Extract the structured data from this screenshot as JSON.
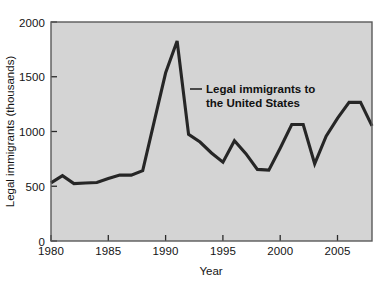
{
  "chart_data": {
    "type": "line",
    "title": "",
    "xlabel": "Year",
    "ylabel": "Legal immigrants (thousands)",
    "xlim": [
      1980,
      2008
    ],
    "ylim": [
      0,
      2000
    ],
    "xticks": [
      1980,
      1985,
      1990,
      1995,
      2000,
      2005
    ],
    "xtick_labels": [
      "1980",
      "1985",
      "1990",
      "1995",
      "2000",
      "2005"
    ],
    "yticks": [
      0,
      500,
      1000,
      1500,
      2000
    ],
    "ytick_labels": [
      "0",
      "500",
      "1000",
      "1500",
      "2000"
    ],
    "grid": false,
    "legend": "none",
    "plot_background": "#d4d4d4",
    "line_color": "#262626",
    "annotations": [
      {
        "text_line_1": "Legal immigrants to",
        "text_line_2": "the United States",
        "x": 1992.5,
        "y": 1330
      }
    ],
    "series": [
      {
        "name": "Legal immigrants to the United States",
        "x": [
          1980,
          1981,
          1982,
          1983,
          1984,
          1985,
          1986,
          1987,
          1988,
          1989,
          1990,
          1991,
          1992,
          1993,
          1994,
          1995,
          1996,
          1997,
          1998,
          1999,
          2000,
          2001,
          2002,
          2003,
          2004,
          2005,
          2006,
          2007,
          2008
        ],
        "values": [
          531,
          597,
          524,
          530,
          534,
          570,
          602,
          602,
          643,
          1091,
          1536,
          1827,
          974,
          904,
          804,
          720,
          916,
          798,
          654,
          647,
          850,
          1064,
          1064,
          705,
          958,
          1122,
          1266,
          1266,
          1052
        ]
      }
    ]
  }
}
